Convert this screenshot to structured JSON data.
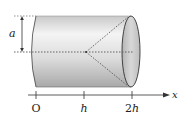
{
  "figure": {
    "labels": {
      "radius": "a",
      "origin": "O",
      "tick_h": "h",
      "tick_2h": "2h",
      "axis": "x"
    },
    "colors": {
      "stroke": "#333333",
      "body_light": "#f2f2f2",
      "body_dark": "#b8b8b8",
      "cap": "#c4c4c4",
      "dashed": "#555555"
    }
  }
}
